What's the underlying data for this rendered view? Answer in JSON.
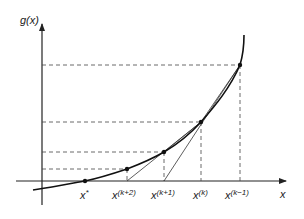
{
  "axes": {
    "y_label": "g(x)",
    "x_label": "x"
  },
  "points": [
    {
      "id": "x_star",
      "label_base": "x",
      "label_sup": "*",
      "x": 85,
      "y": 181
    },
    {
      "id": "x_k_plus_2",
      "label_base": "x",
      "label_sup": "(k+2)",
      "x": 127,
      "y": 169
    },
    {
      "id": "x_k_plus_1",
      "label_base": "x",
      "label_sup": "(k+1)",
      "x": 164,
      "y": 152
    },
    {
      "id": "x_k",
      "label_base": "x",
      "label_sup": "(k)",
      "x": 201,
      "y": 122
    },
    {
      "id": "x_k_minus_1",
      "label_base": "x",
      "label_sup": "(k−1)",
      "x": 240,
      "y": 65
    }
  ],
  "colors": {
    "curve": "#111111",
    "lines": "#333333",
    "dashes": "#444444"
  }
}
